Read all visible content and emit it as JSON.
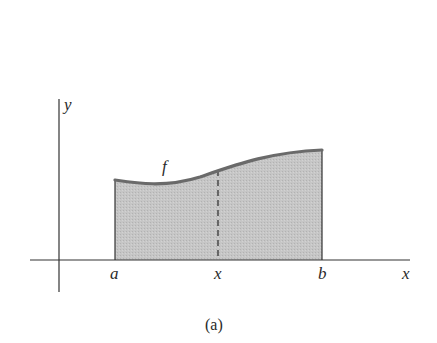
{
  "figure": {
    "caption": "(a)",
    "axes": {
      "x_label": "x",
      "y_label": "y"
    },
    "function_label": "f",
    "points": {
      "a_label": "a",
      "x_label": "x",
      "b_label": "b"
    },
    "colors": {
      "fill": "#c4c4c4",
      "curve": "#6a6a6a",
      "axis": "#333333"
    }
  }
}
